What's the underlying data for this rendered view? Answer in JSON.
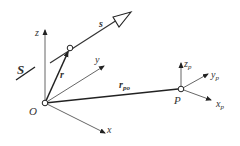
{
  "diagram": {
    "labels": {
      "S": "S",
      "s": "s",
      "z": "z",
      "y": "y",
      "x": "x",
      "r": "r",
      "O": "O",
      "r_po_base": "r",
      "r_po_sub": "po",
      "P": "P",
      "zp_base": "z",
      "zp_sub": "p",
      "yp_base": "y",
      "yp_sub": "p",
      "xp_base": "x",
      "xp_sub": "p"
    },
    "colors": {
      "line": "#333333",
      "axis": "#555555",
      "background": "#ffffff"
    }
  }
}
